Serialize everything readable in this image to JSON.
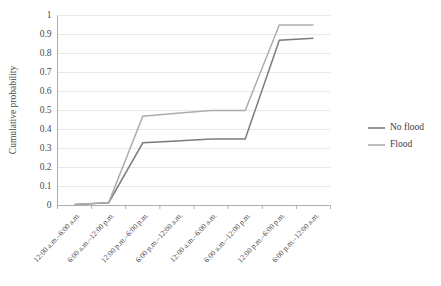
{
  "chart_data": {
    "type": "line",
    "title": "",
    "xlabel": "",
    "ylabel": "Cumulative probability",
    "ylim": [
      0,
      1
    ],
    "ytick_labels": [
      "0",
      "0.1",
      "0.2",
      "0.3",
      "0.4",
      "0.5",
      "0.6",
      "0.7",
      "0.8",
      "0.9",
      "1"
    ],
    "ytick_values": [
      0,
      0.1,
      0.2,
      0.3,
      0.4,
      0.5,
      0.6,
      0.7,
      0.8,
      0.9,
      1
    ],
    "grid": true,
    "legend_position": "right",
    "categories": [
      "12:00 a.m.–6:00 a.m.",
      "6:00 a.m.–12:00 p.m.",
      "12:00 p.m.–6:00 p.m.",
      "6:00 p.m.–12:00 a.m.",
      "12:00 a.m.–6:00 a.m.",
      "6:00 a.m.–12:00 p.m.",
      "12:00 p.m.–6:00 p.m.",
      "6:00 p.m.–12:00 a.m."
    ],
    "series": [
      {
        "name": "No flood",
        "color": "#7c7c7c",
        "values": [
          0.005,
          0.015,
          0.33,
          0.34,
          0.35,
          0.35,
          0.87,
          0.88
        ]
      },
      {
        "name": "Flood",
        "color": "#adadad",
        "values": [
          0.005,
          0.015,
          0.47,
          0.485,
          0.5,
          0.5,
          0.95,
          0.95
        ]
      }
    ]
  },
  "legend": {
    "items": [
      {
        "label": "No flood",
        "color": "#7c7c7c"
      },
      {
        "label": "Flood",
        "color": "#adadad"
      }
    ]
  }
}
